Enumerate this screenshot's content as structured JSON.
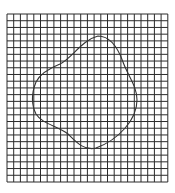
{
  "caption": {
    "text": "",
    "note": "top text line cropped off, illegible"
  },
  "grid": {
    "x": 7,
    "y": 14,
    "cols": 24,
    "rows": 25,
    "cell_w": 6.7,
    "cell_h": 6.72,
    "line_color": "#2a2a2a",
    "background": "#ffffff"
  },
  "shape": {
    "type": "closed irregular curve",
    "stroke": "#333333",
    "path": "M 98 36 C 110 36, 118 48, 123 62 C 128 76, 137 86, 137 100 C 137 120, 118 140, 96 148 C 84 151, 76 142, 68 134 C 58 126, 42 124, 36 114 C 31 104, 32 92, 36 82 C 40 74, 50 68, 60 64 C 72 58, 82 40, 98 36 Z"
  }
}
